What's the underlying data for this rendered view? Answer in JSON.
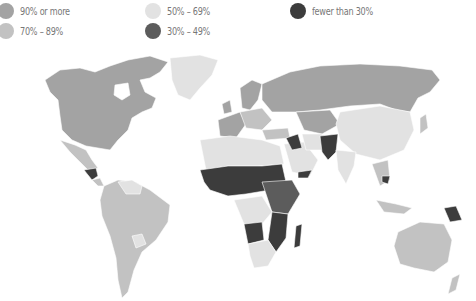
{
  "legend": {
    "items": [
      {
        "label": "90% or more",
        "color": "#a3a3a3"
      },
      {
        "label": "70% – 89%",
        "color": "#c2c2c2"
      },
      {
        "label": "50% – 69%",
        "color": "#e2e2e2"
      },
      {
        "label": "30% – 49%",
        "color": "#5c5c5c"
      },
      {
        "label": "fewer than 30%",
        "color": "#3c3c3c"
      }
    ]
  },
  "map": {
    "type": "choropleth world map",
    "categories": [
      "90% or more",
      "70% – 89%",
      "50% – 69%",
      "30% – 49%",
      "fewer than 30%"
    ],
    "regions": {
      "north_america": "90% or more",
      "mexico": "70% – 89%",
      "central_america_guatemala_honduras": "fewer than 30%",
      "south_america": "70% – 89%",
      "venezuela_guyana": "50% – 69%",
      "bolivia": "50% – 69%",
      "greenland": "50% – 69%",
      "europe_north": "90% or more",
      "europe_central": "70% – 89%",
      "russia": "90% or more",
      "kazakhstan_central_asia": "90% or more",
      "china_mongolia": "50% – 69%",
      "india": "50% – 69%",
      "middle_east_arabia": "50% – 69%",
      "iraq_syria": "fewer than 30%",
      "afghanistan_pakistan": "fewer than 30%",
      "yemen": "fewer than 30%",
      "north_africa": "50% – 69%",
      "sahel_west_africa": "fewer than 30%",
      "central_east_africa": "30% – 49%",
      "angola_mozambique_madagascar": "fewer than 30%",
      "southern_africa": "50% – 69%",
      "southeast_asia_cambodia": "fewer than 30%",
      "indonesia": "70% – 89%",
      "papua_new_guinea": "fewer than 30%",
      "australia_new_zealand": "70% – 89%",
      "japan": "70% – 89%"
    }
  }
}
